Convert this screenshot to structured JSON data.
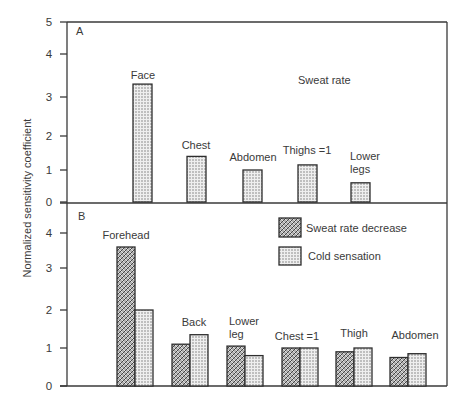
{
  "chart_data": {
    "type": "bar",
    "ylabel": "Normalized sensitivity coefficient",
    "panels": [
      {
        "id": "A",
        "title": "Sweat rate",
        "ylim": [
          0,
          5
        ],
        "yticks": [
          0,
          1,
          2,
          3,
          4,
          5
        ],
        "categories": [
          "Face",
          "Chest",
          "Abdomen",
          "Thighs =1",
          "Lower legs"
        ],
        "series": [
          {
            "name": "Sweat rate",
            "values": [
              3.3,
              1.4,
              1.0,
              1.15,
              0.6
            ]
          }
        ]
      },
      {
        "id": "B",
        "title": "",
        "ylim": [
          0,
          4.5
        ],
        "yticks": [
          0,
          1,
          2,
          3,
          4
        ],
        "categories": [
          "Forehead",
          "Back",
          "Lower leg",
          "Chest =1",
          "Thigh",
          "Abdomen"
        ],
        "series": [
          {
            "name": "Sweat rate decrease",
            "values": [
              3.6,
              1.1,
              1.05,
              1.0,
              0.9,
              0.75
            ]
          },
          {
            "name": "Cold sensation",
            "values": [
              2.0,
              1.35,
              0.8,
              1.0,
              1.0,
              0.85
            ]
          }
        ],
        "legend": [
          "Sweat rate decrease",
          "Cold sensation"
        ],
        "legend_position": "upper right"
      }
    ],
    "grid": false
  },
  "labels": {
    "panel_a": "A",
    "panel_b": "B",
    "sweat_rate_title": "Sweat rate",
    "legend_sweat": "Sweat rate decrease",
    "legend_cold": "Cold sensation"
  },
  "colors": {
    "ink": "#2e2e2e",
    "dot_fill": "#d9d9d9",
    "background": "#ffffff"
  }
}
